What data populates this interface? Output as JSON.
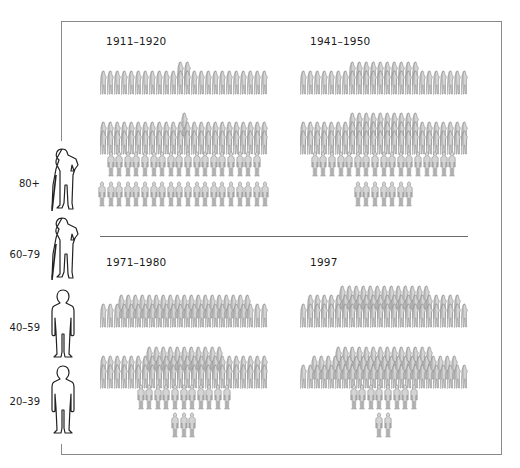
{
  "legend": {
    "items": [
      {
        "label": "80+",
        "icon": "elderly-person-with-cane-icon"
      },
      {
        "label": "60–79",
        "icon": "elderly-person-with-cane-icon"
      },
      {
        "label": "40–59",
        "icon": "adult-person-icon"
      },
      {
        "label": "20–39",
        "icon": "adult-person-icon"
      }
    ]
  },
  "panels": [
    {
      "title": "1911–1920"
    },
    {
      "title": "1941–1950"
    },
    {
      "title": "1971–1980"
    },
    {
      "title": "1997"
    }
  ],
  "colors": {
    "figure_fill": "#d4d4d4",
    "figure_stroke": "#8c8c8c",
    "frame": "#8a8a8a",
    "text": "#1a1a1a"
  },
  "chart_data": {
    "type": "pictogram-pyramid",
    "title": "",
    "xlabel": "",
    "ylabel": "Age group",
    "categories": [
      "80+",
      "60–79",
      "40–59",
      "20–39"
    ],
    "periods": [
      "1911–1920",
      "1941–1950",
      "1971–1980",
      "1997"
    ],
    "unit": "figures (relative count per age group)",
    "series": [
      {
        "name": "1911–1920",
        "values": [
          26,
          49,
          18,
          20
        ]
      },
      {
        "name": "1941–1950",
        "values": [
          34,
          58,
          17,
          7
        ]
      },
      {
        "name": "1971–1980",
        "values": [
          43,
          59,
          11,
          3
        ]
      },
      {
        "name": "1997",
        "values": [
          59,
          59,
          8,
          2
        ]
      }
    ],
    "layers": {
      "1911–1920": {
        "80+": [
          24,
          2
        ],
        "60–79": [
          24,
          24,
          1
        ],
        "40–59": [
          18
        ],
        "20–39": [
          20
        ]
      },
      "1941–1950": {
        "80+": [
          24,
          10
        ],
        "60–79": [
          24,
          24,
          10
        ],
        "40–59": [
          17
        ],
        "20–39": [
          7
        ]
      },
      "1971–1980": {
        "80+": [
          24,
          19
        ],
        "60–79": [
          24,
          24,
          11
        ],
        "40–59": [
          11
        ],
        "20–39": [
          3
        ]
      },
      "1997": {
        "80+": [
          24,
          22,
          13
        ],
        "60–79": [
          24,
          21,
          14
        ],
        "40–59": [
          8
        ],
        "20–39": [
          2
        ]
      }
    },
    "legend_position": "left",
    "grid": false
  }
}
